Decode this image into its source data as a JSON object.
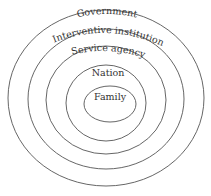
{
  "diagram": {
    "type": "nested-ellipses",
    "layers": [
      {
        "label": "Government",
        "level": 1
      },
      {
        "label": "Interventive institution",
        "level": 2
      },
      {
        "label": "Service agency",
        "level": 3
      },
      {
        "label": "Nation",
        "level": 4
      },
      {
        "label": "Family",
        "level": 5
      }
    ],
    "stroke_color": "#555555",
    "background": "#ffffff"
  }
}
